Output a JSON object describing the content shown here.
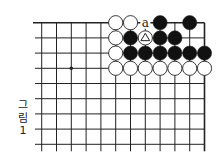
{
  "diagram": {
    "caption": [
      "그",
      "림",
      "1"
    ],
    "colors": {
      "line": "#222222",
      "black_stone": "#111111",
      "white_stone": "#ffffff",
      "background": "#ffffff"
    },
    "grid": {
      "columns": 12,
      "rows": 9,
      "origin_x": 41.7,
      "origin_y": 22.7,
      "spacing_x": 14.8,
      "spacing_y": 15.2,
      "top_edge": true,
      "right_edge": true
    },
    "star_points": [
      {
        "col": 2,
        "row": 3
      }
    ],
    "stones": [
      {
        "col": 5,
        "row": 0,
        "color": "white"
      },
      {
        "col": 6,
        "row": 0,
        "color": "white"
      },
      {
        "col": 8,
        "row": 0,
        "color": "black"
      },
      {
        "col": 10,
        "row": 0,
        "color": "black"
      },
      {
        "col": 5,
        "row": 1,
        "color": "white"
      },
      {
        "col": 6,
        "row": 1,
        "color": "black"
      },
      {
        "col": 7,
        "row": 1,
        "color": "white",
        "mark": "triangle"
      },
      {
        "col": 8,
        "row": 1,
        "color": "black"
      },
      {
        "col": 9,
        "row": 1,
        "color": "black"
      },
      {
        "col": 5,
        "row": 2,
        "color": "white"
      },
      {
        "col": 6,
        "row": 2,
        "color": "black"
      },
      {
        "col": 7,
        "row": 2,
        "color": "black"
      },
      {
        "col": 8,
        "row": 2,
        "color": "black"
      },
      {
        "col": 9,
        "row": 2,
        "color": "black"
      },
      {
        "col": 10,
        "row": 2,
        "color": "black"
      },
      {
        "col": 11,
        "row": 2,
        "color": "black"
      },
      {
        "col": 5,
        "row": 3,
        "color": "white"
      },
      {
        "col": 6,
        "row": 3,
        "color": "white"
      },
      {
        "col": 7,
        "row": 3,
        "color": "white"
      },
      {
        "col": 8,
        "row": 3,
        "color": "white"
      },
      {
        "col": 9,
        "row": 3,
        "color": "white"
      },
      {
        "col": 10,
        "row": 3,
        "color": "white"
      },
      {
        "col": 11,
        "row": 3,
        "color": "white"
      }
    ],
    "labels": [
      {
        "col": 7,
        "row": 0,
        "text": "a"
      }
    ]
  }
}
